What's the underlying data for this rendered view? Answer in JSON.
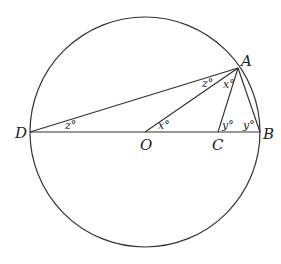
{
  "diagram": {
    "points": {
      "A": {
        "label": "A",
        "x": 238,
        "y": 68
      },
      "B": {
        "label": "B",
        "x": 260,
        "y": 132
      },
      "C": {
        "label": "C",
        "x": 218,
        "y": 132
      },
      "D": {
        "label": "D",
        "x": 30,
        "y": 132
      },
      "O": {
        "label": "O",
        "x": 145,
        "y": 132
      }
    },
    "angles": {
      "z_at_D": "z°",
      "z_at_A": "z°",
      "x_at_A": "x°",
      "x_at_O": "x°",
      "y_at_C": "y°",
      "y_at_B": "y°"
    },
    "circle": {
      "cx": 145,
      "cy": 132,
      "r": 115
    },
    "line_color": "#333333"
  }
}
